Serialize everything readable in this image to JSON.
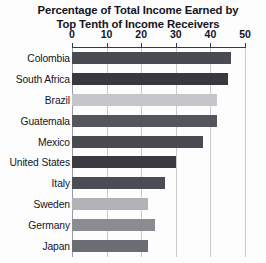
{
  "chart_data": {
    "type": "bar",
    "orientation": "horizontal",
    "title": "Percentage of Total Income Earned by Top Tenth of Income Receivers",
    "title_lines": [
      "Percentage of Total Income Earned by",
      "Top Tenth of Income Receivers"
    ],
    "xlabel": "",
    "ylabel": "",
    "xlim": [
      0,
      50
    ],
    "xticks": [
      0,
      10,
      20,
      30,
      40,
      50
    ],
    "xtick_labels": [
      "0",
      "10",
      "20",
      "30",
      "40",
      "50"
    ],
    "grid": true,
    "grid_axis": "x",
    "axis_position": "top",
    "legend": false,
    "categories": [
      "Colombia",
      "South Africa",
      "Brazil",
      "Guatemala",
      "Mexico",
      "United States",
      "Italy",
      "Sweden",
      "Germany",
      "Japan"
    ],
    "values": [
      46,
      45,
      42,
      42,
      38,
      30,
      27,
      22,
      24,
      22
    ],
    "bar_colors": [
      "#4a4a52",
      "#38383f",
      "#c6c6ca",
      "#55555c",
      "#4a4a52",
      "#3a3a41",
      "#4c4c54",
      "#b2b2b8",
      "#8b8b92",
      "#6c6c74"
    ]
  },
  "style": {
    "background": "#fdfdfd",
    "grid_color": "#c9c9cf",
    "axis_color": "#3a3a46",
    "text_color": "#14141f"
  }
}
